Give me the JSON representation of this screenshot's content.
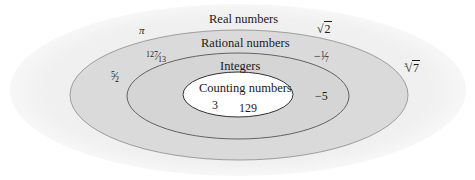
{
  "diagram": {
    "type": "nested-venn",
    "colors": {
      "background": "#ffffff",
      "real_fill": "#f1f1f1",
      "rational_fill": "#dadada",
      "rational_stroke": "#8a8a8a",
      "integers_fill": "#d5d5d5",
      "integers_stroke": "#555555",
      "counting_fill": "#ffffff",
      "counting_stroke": "#333333",
      "text": "#1a1a1a"
    },
    "sets": {
      "real": {
        "label": "Real numbers"
      },
      "rational": {
        "label": "Rational numbers"
      },
      "integers": {
        "label": "Integers"
      },
      "counting": {
        "label": "Counting numbers"
      }
    },
    "elements": {
      "real_only": {
        "pi": "π",
        "sqrt2": {
          "radicand": "2"
        },
        "cbrt7": {
          "index": "3",
          "radicand": "7"
        }
      },
      "rational_only": {
        "frac_127_13": {
          "num": "127",
          "den": "13"
        },
        "frac_5_2": {
          "num": "5",
          "den": "2"
        },
        "frac_neg_1_7": {
          "sign": "−",
          "num": "1",
          "den": "7"
        }
      },
      "integers_only": {
        "neg5": "−5"
      },
      "counting": {
        "three": "3",
        "n129": "129"
      }
    }
  }
}
